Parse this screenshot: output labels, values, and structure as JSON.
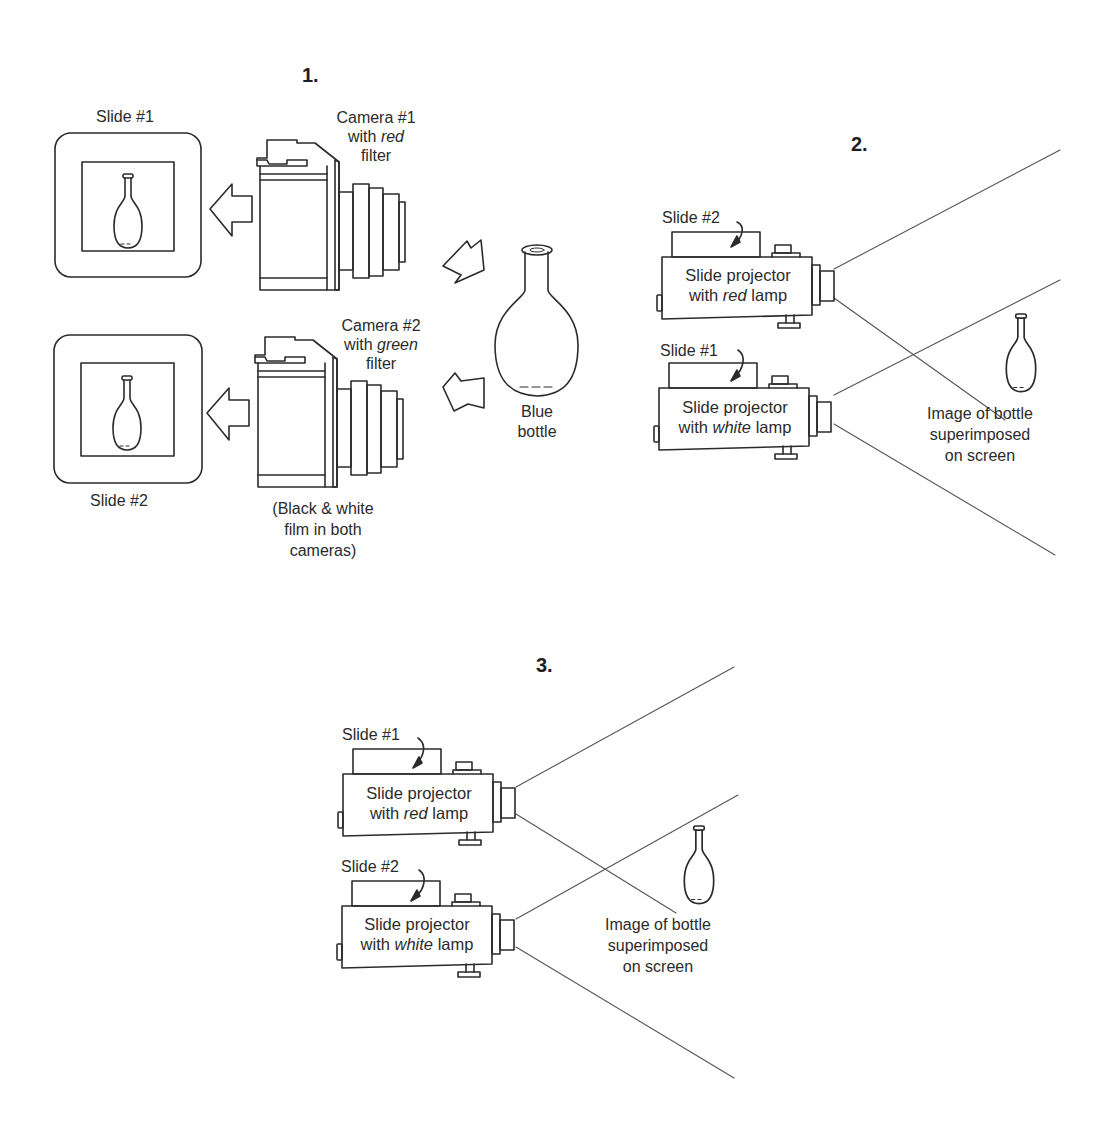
{
  "steps": {
    "step1": "1.",
    "step2": "2.",
    "step3": "3."
  },
  "panel1": {
    "slide1_label": "Slide #1",
    "slide2_label": "Slide #2",
    "camera1": {
      "line1": "Camera #1",
      "line2_prefix": "with ",
      "line2_em": "red",
      "line3": "filter"
    },
    "camera2": {
      "line1": "Camera #2",
      "line2_prefix": "with ",
      "line2_em": "green",
      "line3": "filter"
    },
    "film_note": {
      "line1": "(Black & white",
      "line2": "film in both",
      "line3": "cameras)"
    },
    "subject": {
      "line1": "Blue",
      "line2": "bottle"
    }
  },
  "panel2": {
    "top_projector": {
      "slide_label": "Slide #2",
      "line1": "Slide projector",
      "line2_prefix": "with ",
      "line2_em": "red",
      "line2_suffix": " lamp"
    },
    "bottom_projector": {
      "slide_label": "Slide #1",
      "line1": "Slide projector",
      "line2_prefix": "with ",
      "line2_em": "white",
      "line2_suffix": " lamp"
    },
    "screen_caption": {
      "line1": "Image of bottle",
      "line2": "superimposed",
      "line3": "on screen"
    }
  },
  "panel3": {
    "top_projector": {
      "slide_label": "Slide #1",
      "line1": "Slide projector",
      "line2_prefix": "with ",
      "line2_em": "red",
      "line2_suffix": " lamp"
    },
    "bottom_projector": {
      "slide_label": "Slide #2",
      "line1": "Slide projector",
      "line2_prefix": "with ",
      "line2_em": "white",
      "line2_suffix": " lamp"
    },
    "screen_caption": {
      "line1": "Image of bottle",
      "line2": "superimposed",
      "line3": "on screen"
    }
  },
  "colors": {
    "ink": "#2b2b2b",
    "background": "#ffffff",
    "beam": "#555555"
  }
}
